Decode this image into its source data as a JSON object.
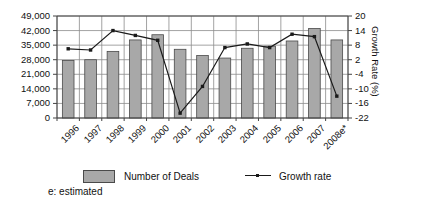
{
  "chart_data": {
    "type": "bar",
    "title": "",
    "xlabel": "",
    "ylabel": "",
    "y2label": "Growth Rate (%)",
    "grid": true,
    "legend_position": "bottom",
    "categories": [
      "1996",
      "1997",
      "1998",
      "1999",
      "2000",
      "2001",
      "2002",
      "2003",
      "2004",
      "2005",
      "2006",
      "2007",
      "2008e*"
    ],
    "ylim": [
      0,
      49000
    ],
    "yticks": [
      "0",
      "7,000",
      "14,000",
      "21,000",
      "28,000",
      "35,000",
      "42,000",
      "49,000"
    ],
    "ytick_values": [
      0,
      7000,
      14000,
      21000,
      28000,
      35000,
      42000,
      49000
    ],
    "y2lim": [
      -22,
      20
    ],
    "y2ticks": [
      "-22",
      "-16",
      "-10",
      "-4",
      "2",
      "8",
      "14",
      "20"
    ],
    "y2tick_values": [
      -22,
      -16,
      -10,
      -4,
      2,
      8,
      14,
      20
    ],
    "series": [
      {
        "name": "Number of Deals",
        "type": "bar",
        "axis": "left",
        "color": "#a8a8a8",
        "edge_color": "#4a4a4a",
        "values": [
          27600,
          28000,
          32000,
          37500,
          40000,
          33000,
          30000,
          28800,
          33500,
          34500,
          37000,
          43000,
          37500
        ]
      },
      {
        "name": "Growth rate",
        "type": "line",
        "axis": "right",
        "color": "#1a1a1a",
        "marker": "square",
        "values": [
          6.5,
          6,
          14,
          12,
          10,
          -20,
          -9,
          7,
          8.5,
          7,
          12.5,
          11.5,
          -13
        ]
      }
    ],
    "annotations": [
      "e: estimated"
    ]
  },
  "legend": {
    "bars_label": "Number of Deals",
    "line_label": "Growth rate",
    "footnote": "e: estimated"
  }
}
